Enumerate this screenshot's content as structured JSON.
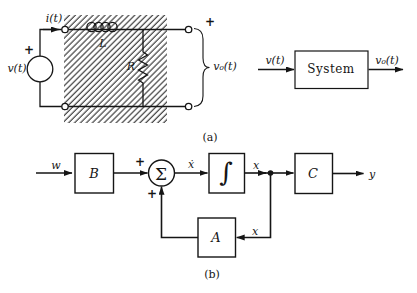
{
  "colors": {
    "ink": "#151515",
    "background": "#ffffff"
  },
  "part_a": {
    "caption": "(a)",
    "circuit": {
      "source_plus": "+",
      "source_label": "v(t)",
      "current_label": "i(t)",
      "inductor_label": "L",
      "resistor_label": "R",
      "output_plus": "+",
      "output_label": "v₀(t)"
    },
    "system": {
      "input_label": "v(t)",
      "box_label": "System",
      "output_label": "v₀(t)"
    }
  },
  "part_b": {
    "caption": "(b)",
    "input_label": "w",
    "block_b": "B",
    "sum_plus_input": "+",
    "sum_symbol": "Σ",
    "sum_plus_feedback": "+",
    "xdot_label": "ẋ",
    "integrator_symbol": "∫",
    "state_label": "x",
    "block_c": "C",
    "output_label": "y",
    "feedback_label": "x",
    "block_a": "A"
  }
}
